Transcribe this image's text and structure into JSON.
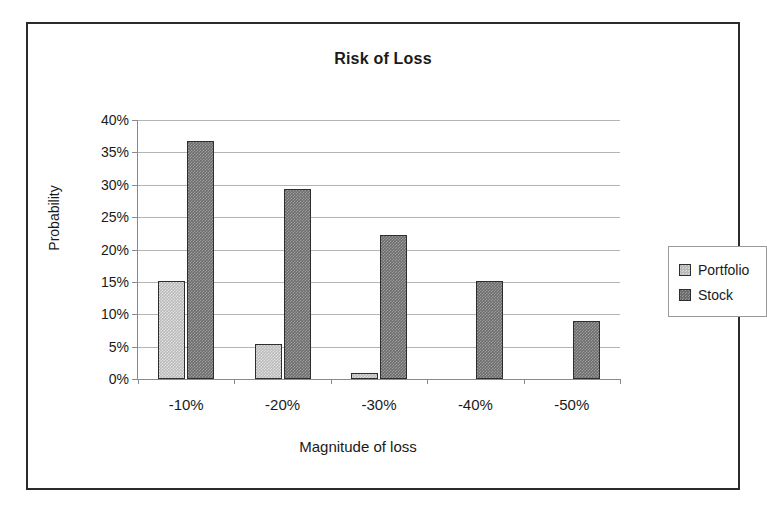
{
  "chart_data": {
    "type": "bar",
    "title": "Risk of Loss",
    "xlabel": "Magnitude of loss",
    "ylabel": "Probability",
    "categories": [
      "-10%",
      "-20%",
      "-30%",
      "-40%",
      "-50%"
    ],
    "series": [
      {
        "name": "Portfolio",
        "color": "#b9b9b9",
        "values": [
          15.2,
          5.4,
          0.9,
          0,
          0
        ]
      },
      {
        "name": "Stock",
        "color": "#6e6e6e",
        "values": [
          36.8,
          29.3,
          22.3,
          15.2,
          9.0
        ]
      }
    ],
    "ylim": [
      0,
      40
    ],
    "ytick_values": [
      0,
      5,
      10,
      15,
      20,
      25,
      30,
      35,
      40
    ],
    "ytick_labels": [
      "0%",
      "5%",
      "10%",
      "15%",
      "20%",
      "25%",
      "30%",
      "35%",
      "40%"
    ],
    "grid": true,
    "legend_position": "right",
    "value_unit": "%"
  },
  "legend": {
    "entries": [
      {
        "label": "Portfolio"
      },
      {
        "label": "Stock"
      }
    ]
  }
}
